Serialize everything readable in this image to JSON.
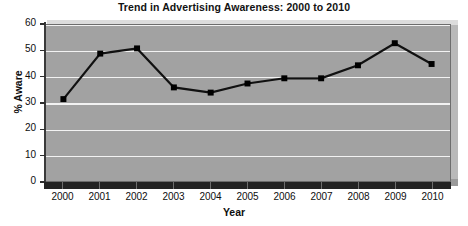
{
  "chart_data": {
    "type": "line",
    "title": "Trend in Advertising Awareness: 2000 to 2010",
    "xlabel": "Year",
    "ylabel": "% Aware",
    "categories": [
      "2000",
      "2001",
      "2002",
      "2003",
      "2004",
      "2005",
      "2006",
      "2007",
      "2008",
      "2009",
      "2010"
    ],
    "values": [
      31.5,
      49,
      51,
      36,
      34,
      37.5,
      39.5,
      39.5,
      44.5,
      53,
      45
    ],
    "series": [
      {
        "name": "% Aware",
        "values": [
          31.5,
          49,
          51,
          36,
          34,
          37.5,
          39.5,
          39.5,
          44.5,
          53,
          45
        ]
      }
    ],
    "ylim": [
      0,
      60
    ],
    "ytick_labels": [
      "0",
      "10",
      "20",
      "30",
      "40",
      "50",
      "60"
    ],
    "ytick_values": [
      0,
      10,
      20,
      30,
      40,
      50,
      60
    ],
    "grid": "horizontal",
    "legend": "none",
    "marker": "square",
    "line_color": "#111111",
    "marker_color": "#000000",
    "plot_background_color": "#a2a2a2",
    "gridline_color": "#f2f2f2",
    "text_color": "#0e0e0e"
  }
}
